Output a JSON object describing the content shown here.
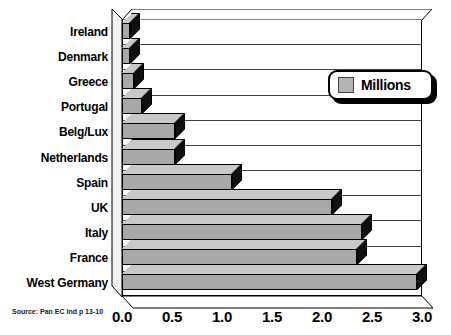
{
  "chart_data": {
    "type": "bar",
    "orientation": "horizontal",
    "title": "",
    "xlabel": "",
    "ylabel": "",
    "xlim": [
      0.0,
      3.0
    ],
    "xticks": [
      "0.0",
      "0.5",
      "1.0",
      "1.5",
      "2.0",
      "2.5",
      "3.0"
    ],
    "xtick_values": [
      0.0,
      0.5,
      1.0,
      1.5,
      2.0,
      2.5,
      3.0
    ],
    "grid": true,
    "grid_axis": "x-categories",
    "legend": {
      "position": "top-right",
      "entries": [
        {
          "label": "Millions",
          "color": "#b4b4b4"
        }
      ]
    },
    "categories": [
      "Ireland",
      "Denmark",
      "Greece",
      "Portugal",
      "Belg/Lux",
      "Netherlands",
      "Spain",
      "UK",
      "Italy",
      "France",
      "West Germany"
    ],
    "values": [
      0.08,
      0.08,
      0.12,
      0.2,
      0.53,
      0.53,
      1.1,
      2.1,
      2.4,
      2.35,
      2.95
    ],
    "series": [
      {
        "name": "Millions",
        "values": [
          0.08,
          0.08,
          0.12,
          0.2,
          0.53,
          0.53,
          1.1,
          2.1,
          2.4,
          2.35,
          2.95
        ]
      }
    ],
    "bar_fill_color": "#a8a8a8",
    "bar_top_color": "#c9c9c9",
    "bar_side_color": "#101010",
    "style": "3d-horizontal-bar"
  },
  "source_note": "Source: Pan EC Ind p 13-10",
  "legend": {
    "label": "Millions"
  }
}
